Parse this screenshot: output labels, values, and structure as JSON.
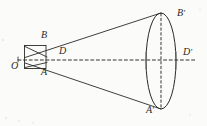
{
  "figure": {
    "kind": "geometry-diagram",
    "background_color": "#fbfbf9",
    "ink_color": "#2a2a28",
    "labels": [
      {
        "id": "O",
        "text": "O",
        "prime": "",
        "x": 11,
        "y": 61
      },
      {
        "id": "B",
        "text": "B",
        "prime": "",
        "x": 41,
        "y": 36
      },
      {
        "id": "A",
        "text": "A",
        "prime": "",
        "x": 41,
        "y": 67
      },
      {
        "id": "D",
        "text": "D",
        "prime": "",
        "x": 59,
        "y": 47
      },
      {
        "id": "Bp",
        "text": "B",
        "prime": "′",
        "x": 177,
        "y": 11
      },
      {
        "id": "Dp",
        "text": "D",
        "prime": "′",
        "x": 183,
        "y": 49
      },
      {
        "id": "Ap",
        "text": "A",
        "prime": "′",
        "x": 147,
        "y": 104
      }
    ],
    "geometry": {
      "apex": {
        "x": 24,
        "y": 60
      },
      "axis_dashed": {
        "x1": 18,
        "y1": 60,
        "x2": 196,
        "y2": 60
      },
      "base_ellipse": {
        "cx": 161,
        "cy": 61,
        "rx": 15,
        "ry": 48
      },
      "minor_axis_dashed": {
        "x1": 161,
        "y1": 13,
        "x2": 161,
        "y2": 109
      },
      "slant_upper": {
        "x1": 26,
        "y1": 57,
        "x2": 161,
        "y2": 13
      },
      "slant_lower": {
        "x1": 26,
        "y1": 63,
        "x2": 161,
        "y2": 109
      },
      "inner_rect": {
        "x": 24,
        "y": 45,
        "width": 22,
        "height": 24
      },
      "inner_chord_top": {
        "x1": 24,
        "y1": 46,
        "x2": 46,
        "y2": 56
      },
      "inner_chord_bottom": {
        "x1": 24,
        "y1": 68,
        "x2": 46,
        "y2": 64
      }
    }
  }
}
